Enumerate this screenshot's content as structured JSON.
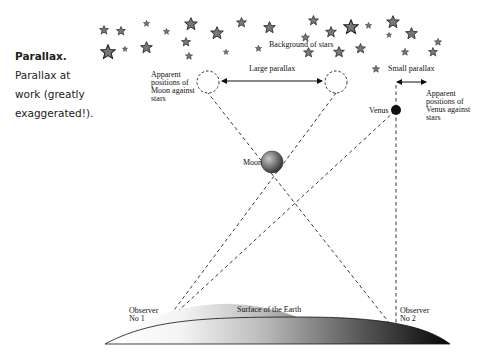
{
  "caption": {
    "title": "Parallax.",
    "text": " Parallax at work (greatly exaggerated!)."
  },
  "labels": {
    "background_stars": "Background of stars",
    "large_parallax": "Large parallax",
    "small_parallax": "Small parallax",
    "moon_positions": [
      "Apparent",
      "positions of",
      "Moon against",
      "stars"
    ],
    "venus_positions": [
      "Apparent",
      "positions of",
      "Venus against",
      "stars"
    ],
    "moon": "Moon",
    "venus": "Venus",
    "surface": "Surface of the Earth",
    "observer1": [
      "Observer",
      "No 1"
    ],
    "observer2": [
      "Observer",
      "No 2"
    ]
  },
  "colors": {
    "star_fill": "#777777",
    "star_stroke": "#222222",
    "venus": "#111111",
    "moon_light": "#bbbbbb",
    "moon_dark": "#333333"
  }
}
